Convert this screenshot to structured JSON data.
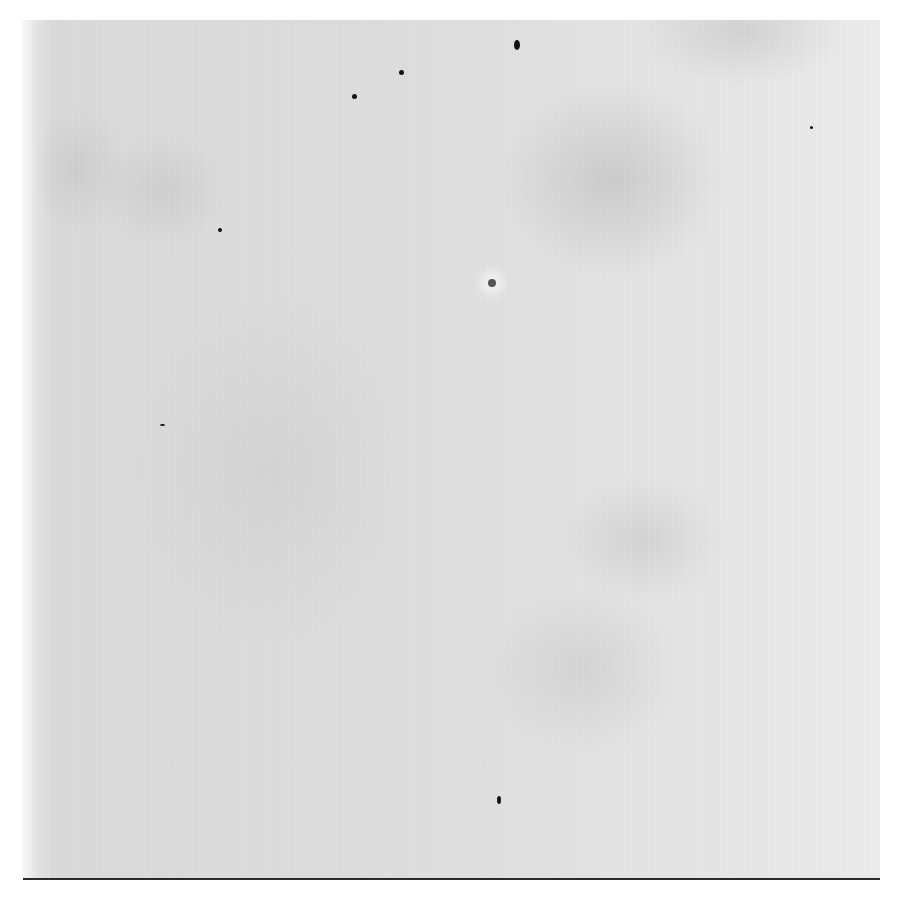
{
  "image": {
    "description": "Blank paper sheet with stains and specks",
    "background_color": "#ffffff",
    "paper_color": "#e2e2e2",
    "stain_color": "#8a8a8a",
    "edge_color": "#2a2a2a"
  },
  "specks": [
    {
      "name": "speck-1",
      "x": 514,
      "y": 40,
      "w": 6,
      "h": 10
    },
    {
      "name": "speck-2",
      "x": 399,
      "y": 70,
      "w": 5,
      "h": 5
    },
    {
      "name": "speck-3",
      "x": 352,
      "y": 94,
      "w": 5,
      "h": 5
    },
    {
      "name": "speck-4",
      "x": 218,
      "y": 228,
      "w": 4,
      "h": 4
    },
    {
      "name": "speck-5",
      "x": 810,
      "y": 126,
      "w": 3,
      "h": 3
    },
    {
      "name": "speck-6",
      "x": 497,
      "y": 796,
      "w": 4,
      "h": 8
    },
    {
      "name": "speck-7",
      "x": 160,
      "y": 424,
      "w": 5,
      "h": 2
    }
  ],
  "blots": [
    {
      "name": "ring-blot",
      "x": 492,
      "y": 283,
      "d": 8
    }
  ]
}
